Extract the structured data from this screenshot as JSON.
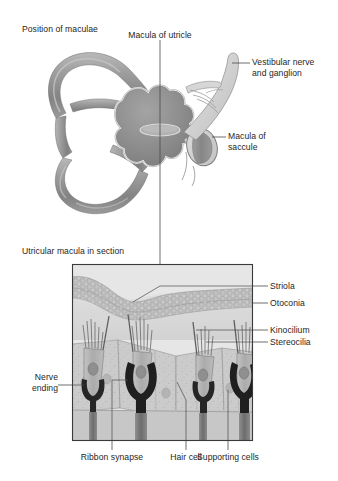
{
  "figure": {
    "title_top": "Position of maculae",
    "title_bottom": "Utricular macula in section",
    "background_color": "#ffffff",
    "text_color": "#262626",
    "leader_color": "#4a4a4a"
  },
  "panel_top": {
    "name": "position-of-maculae-panel",
    "heading": "Position of maculae",
    "labels": {
      "macula_of_utricle": "Macula of utricle",
      "vestibular_nerve_line1": "Vestibular nerve",
      "vestibular_nerve_line2": "and ganglion",
      "macula_of_saccule_line1": "Macula of",
      "macula_of_saccule_line2": "saccule"
    },
    "structures": [
      {
        "name": "superior-semicircular-canal",
        "fill": "#9a9a9a"
      },
      {
        "name": "posterior-semicircular-canal",
        "fill": "#9a9a9a"
      },
      {
        "name": "lateral-semicircular-canal",
        "fill": "#9a9a9a"
      },
      {
        "name": "vestibule-utricle",
        "fill": "#8d8d8d"
      },
      {
        "name": "macula-of-utricle-patch",
        "fill": "#b4b4b4"
      },
      {
        "name": "saccule",
        "fill": "#cfcfcf"
      },
      {
        "name": "macula-of-saccule-patch",
        "fill": "#8d8d8d"
      },
      {
        "name": "vestibular-nerve-trunk",
        "fill": "#d2d2d2"
      }
    ]
  },
  "panel_bottom": {
    "name": "utricular-macula-section-panel",
    "heading": "Utricular macula in section",
    "labels": {
      "striola": "Striola",
      "otoconia": "Otoconia",
      "kinocilium": "Kinocilium",
      "stereocilia": "Stereocilia",
      "nerve_ending_line1": "Nerve",
      "nerve_ending_line2": "ending",
      "ribbon_synapse": "Ribbon synapse",
      "hair_cell": "Hair cell",
      "supporting_cells": "Supporting cells"
    },
    "layers": [
      {
        "name": "otoconia-layer",
        "fill": "#b9b9b9"
      },
      {
        "name": "gelatinous-layer",
        "fill": "#d9d9d9"
      },
      {
        "name": "supporting-cell-epithelium",
        "fill": "#cdcdcd"
      },
      {
        "name": "hair-cell-body",
        "fill": "#b0b0b0"
      },
      {
        "name": "nerve-calyx",
        "fill": "#2a2a2a"
      },
      {
        "name": "basal-nerve-fiber",
        "fill": "#6a6a6a"
      }
    ],
    "border_color": "#3a3a3a"
  }
}
